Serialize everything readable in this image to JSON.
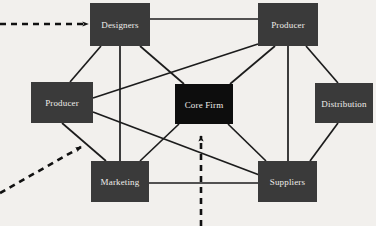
{
  "diagram": {
    "background_color": "#f2f0ed",
    "edge_color": "#1c1c1c",
    "arrow_color": "#111111",
    "nodes": [
      {
        "id": "designers",
        "label": "Designers",
        "x": 90,
        "y": 3,
        "w": 60,
        "h": 43,
        "fill": "#3a3a3a",
        "text_color": "#efedea",
        "role": "peripheral"
      },
      {
        "id": "producer-top",
        "label": "Producer",
        "x": 258,
        "y": 3,
        "w": 60,
        "h": 43,
        "fill": "#3a3a3a",
        "text_color": "#efedea",
        "role": "peripheral"
      },
      {
        "id": "producer-left",
        "label": "Producer",
        "x": 31,
        "y": 82,
        "w": 62,
        "h": 41,
        "fill": "#3a3a3a",
        "text_color": "#efedea",
        "role": "peripheral"
      },
      {
        "id": "core-firm",
        "label": "Core Firm",
        "x": 175,
        "y": 84,
        "w": 58,
        "h": 40,
        "fill": "#0d0d0d",
        "text_color": "#f0eeeb",
        "role": "core"
      },
      {
        "id": "distribution",
        "label": "Distribution",
        "x": 315,
        "y": 83,
        "w": 58,
        "h": 40,
        "fill": "#3a3a3a",
        "text_color": "#efedea",
        "role": "peripheral"
      },
      {
        "id": "marketing",
        "label": "Marketing",
        "x": 91,
        "y": 161,
        "w": 58,
        "h": 41,
        "fill": "#3a3a3a",
        "text_color": "#efedea",
        "role": "peripheral"
      },
      {
        "id": "suppliers",
        "label": "Suppliers",
        "x": 258,
        "y": 161,
        "w": 59,
        "h": 41,
        "fill": "#3a3a3a",
        "text_color": "#efedea",
        "role": "peripheral"
      }
    ],
    "edges": [
      {
        "from": "designers",
        "to": "producer-top",
        "x1": 150,
        "y1": 19,
        "x2": 258,
        "y2": 19
      },
      {
        "from": "designers",
        "to": "producer-left",
        "x1": 101,
        "y1": 46,
        "x2": 70,
        "y2": 82
      },
      {
        "from": "designers",
        "to": "marketing",
        "x1": 120,
        "y1": 46,
        "x2": 120,
        "y2": 161
      },
      {
        "from": "designers",
        "to": "core-firm",
        "x1": 140,
        "y1": 46,
        "x2": 184,
        "y2": 84
      },
      {
        "from": "producer-left",
        "to": "producer-top",
        "x1": 93,
        "y1": 98,
        "x2": 258,
        "y2": 44
      },
      {
        "from": "producer-left",
        "to": "marketing",
        "x1": 62,
        "y1": 123,
        "x2": 106,
        "y2": 161
      },
      {
        "from": "producer-left",
        "to": "suppliers",
        "x1": 93,
        "y1": 112,
        "x2": 262,
        "y2": 176
      },
      {
        "from": "producer-top",
        "to": "core-firm",
        "x1": 275,
        "y1": 46,
        "x2": 230,
        "y2": 84
      },
      {
        "from": "producer-top",
        "to": "distribution",
        "x1": 306,
        "y1": 46,
        "x2": 338,
        "y2": 83
      },
      {
        "from": "producer-top",
        "to": "suppliers",
        "x1": 288,
        "y1": 46,
        "x2": 288,
        "y2": 161
      },
      {
        "from": "distribution",
        "to": "suppliers",
        "x1": 338,
        "y1": 123,
        "x2": 310,
        "y2": 161
      },
      {
        "from": "core-firm",
        "to": "marketing",
        "x1": 179,
        "y1": 124,
        "x2": 140,
        "y2": 161
      },
      {
        "from": "core-firm",
        "to": "suppliers",
        "x1": 228,
        "y1": 124,
        "x2": 266,
        "y2": 161
      },
      {
        "from": "marketing",
        "to": "suppliers",
        "x1": 149,
        "y1": 183,
        "x2": 258,
        "y2": 183
      }
    ],
    "arrows": [
      {
        "id": "inbound-arrow-top-left",
        "style": "dashed",
        "x1": 0,
        "y1": 24,
        "x2": 88,
        "y2": 24,
        "direction": "right",
        "target": "designers"
      },
      {
        "id": "inbound-arrow-bottom-left",
        "style": "dashed",
        "x1": 0,
        "y1": 193,
        "x2": 81,
        "y2": 147,
        "direction": "up-right",
        "target": "marketing"
      },
      {
        "id": "inbound-arrow-bottom-center",
        "style": "dashed",
        "x1": 201,
        "y1": 226,
        "x2": 201,
        "y2": 136,
        "direction": "up",
        "target": "core-firm"
      }
    ]
  }
}
